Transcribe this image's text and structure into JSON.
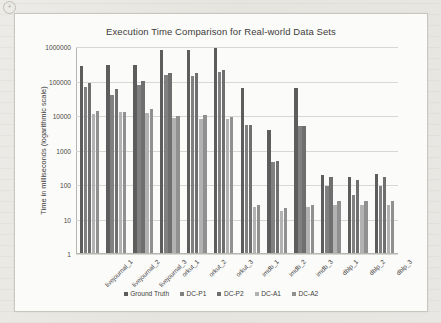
{
  "page": {
    "corner_mark": "+"
  },
  "chart_data": {
    "type": "bar",
    "title": "Execution Time Comparison for Real-world Data Sets",
    "xlabel": "",
    "ylabel": "Time in milliseconds (logarithmic scale)",
    "scale": "log",
    "ylim": [
      1,
      1000000
    ],
    "ytick_labels": [
      "1000000",
      "100000",
      "10000",
      "1000",
      "100",
      "10",
      "1"
    ],
    "ytick_values": [
      1000000,
      100000,
      10000,
      1000,
      100,
      10,
      1
    ],
    "grid": true,
    "legend_position": "bottom",
    "categories": [
      "livejournal_1",
      "livejournal_2",
      "livejournal_3",
      "orkut_1",
      "orkut_2",
      "orkut_3",
      "imdb_1",
      "imdb_2",
      "imdb_3",
      "dblp_1",
      "dblp_2",
      "dblp_3"
    ],
    "series": [
      {
        "name": "Ground Truth",
        "color": "#5d5d5d",
        "values": [
          260000,
          290000,
          290000,
          760000,
          760000,
          900000,
          60000,
          3600,
          60000,
          180,
          160,
          190
        ]
      },
      {
        "name": "DC-P1",
        "color": "#808080",
        "values": [
          65000,
          39000,
          72000,
          145000,
          135000,
          180000,
          5000,
          430,
          4700,
          90,
          47,
          90
        ]
      },
      {
        "name": "DC-P2",
        "color": "#6f6f6f",
        "values": [
          85000,
          57000,
          97000,
          165000,
          160000,
          200000,
          5100,
          470,
          4900,
          155,
          130,
          160
        ]
      },
      {
        "name": "DC-A1",
        "color": "#b2b2b2",
        "values": [
          11000,
          12000,
          11500,
          8200,
          7800,
          7600,
          21,
          17,
          21,
          25,
          24,
          24
        ]
      },
      {
        "name": "DC-A2",
        "color": "#909090",
        "values": [
          13500,
          12500,
          14500,
          9600,
          10000,
          9000,
          25,
          20,
          25,
          32,
          33,
          33
        ]
      }
    ]
  }
}
